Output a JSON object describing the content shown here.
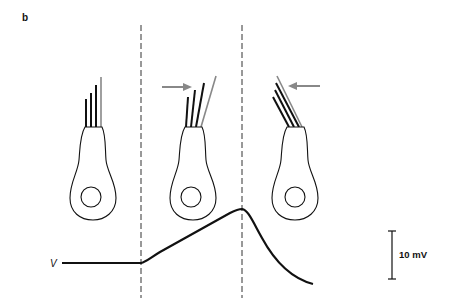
{
  "figure": {
    "panel_label": "b",
    "trace_label": "V",
    "scale_bar_label": "10 mV",
    "colors": {
      "stereocilia": "#111111",
      "kinocilium": "#888888",
      "arrow": "#888888",
      "trace": "#111111",
      "dashed_line": "#333333"
    },
    "cells": [
      {
        "id": "rest",
        "state": "resting",
        "arrow": "none"
      },
      {
        "id": "depolarized",
        "state": "deflected toward kinocilium",
        "arrow": "right"
      },
      {
        "id": "hyperpolarized",
        "state": "deflected away from kinocilium",
        "arrow": "left"
      }
    ],
    "trace_description": "Membrane potential: flat baseline, ramps up during deflection toward kinocilium, peaks at second dashed line, then decays below baseline during opposite deflection",
    "icons": [
      "hair-cell",
      "arrow-right-icon",
      "arrow-left-icon",
      "scale-bar"
    ]
  }
}
